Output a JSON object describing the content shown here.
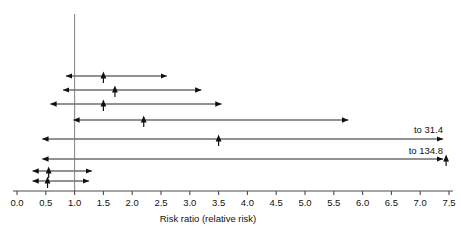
{
  "chart_data": {
    "type": "forest",
    "title": "",
    "xlabel": "Risk ratio (relative risk)",
    "ylabel": "",
    "xlim": [
      0.0,
      7.5
    ],
    "xticks": [
      "0.0",
      "0.5",
      "1.0",
      "1.5",
      "2.0",
      "2.5",
      "3.0",
      "3.5",
      "4.0",
      "4.5",
      "5.0",
      "5.5",
      "6.0",
      "6.5",
      "7.0",
      "7.5"
    ],
    "xtick_values": [
      0.0,
      0.5,
      1.0,
      1.5,
      2.0,
      2.5,
      3.0,
      3.5,
      4.0,
      4.5,
      5.0,
      5.5,
      6.0,
      6.5,
      7.0,
      7.5
    ],
    "grid": false,
    "legend": "none",
    "reference_line": 1.0,
    "null_value_label": "1.0",
    "studies": [
      {
        "index": 1,
        "point": 1.5,
        "low": 0.85,
        "high": 2.6,
        "low_clipped": false,
        "high_clipped": false,
        "high_label": ""
      },
      {
        "index": 2,
        "point": 1.7,
        "low": 0.8,
        "high": 3.2,
        "low_clipped": false,
        "high_clipped": false,
        "high_label": ""
      },
      {
        "index": 3,
        "point": 1.5,
        "low": 0.58,
        "high": 3.55,
        "low_clipped": false,
        "high_clipped": false,
        "high_label": ""
      },
      {
        "index": 4,
        "point": 2.2,
        "low": 0.98,
        "high": 5.75,
        "low_clipped": false,
        "high_clipped": false,
        "high_label": ""
      },
      {
        "index": 5,
        "point": 3.5,
        "low": 0.44,
        "high": 31.4,
        "low_clipped": false,
        "high_clipped": true,
        "high_label": "to 31.4"
      },
      {
        "index": 6,
        "point": 7.45,
        "low": 0.44,
        "high": 134.8,
        "low_clipped": false,
        "high_clipped": true,
        "high_label": "to 134.8"
      },
      {
        "index": 7,
        "point": 0.55,
        "low": 0.27,
        "high": 1.3,
        "low_clipped": false,
        "high_clipped": false,
        "high_label": ""
      },
      {
        "index": 8,
        "point": 0.53,
        "low": 0.27,
        "high": 1.25,
        "low_clipped": false,
        "high_clipped": false,
        "high_label": ""
      }
    ],
    "annotations": [
      "to 31.4",
      "to 134.8"
    ],
    "colors": {
      "axis": "#4a4a4a",
      "reference_line": "#8a8a8a",
      "interval": "#6e6e6e",
      "marker": "#111111",
      "text": "#111111",
      "background": "#ffffff"
    }
  },
  "geometry": {
    "x_origin_px": 17,
    "px_per_unit": 57.6,
    "axis_y_px": 191,
    "tick_len_px": 4,
    "tick_label_y_px": 206,
    "axis_title_x_px": 208,
    "axis_title_y_px": 222,
    "ref_line_top_px": 14,
    "ref_line_bottom_px": 191,
    "row_y_px": [
      76,
      90,
      104,
      120,
      139,
      159,
      171,
      181
    ],
    "annotation_x_px": [
      443,
      443
    ],
    "annotation_y_px": [
      133,
      154
    ],
    "clip_right_px": 443
  }
}
